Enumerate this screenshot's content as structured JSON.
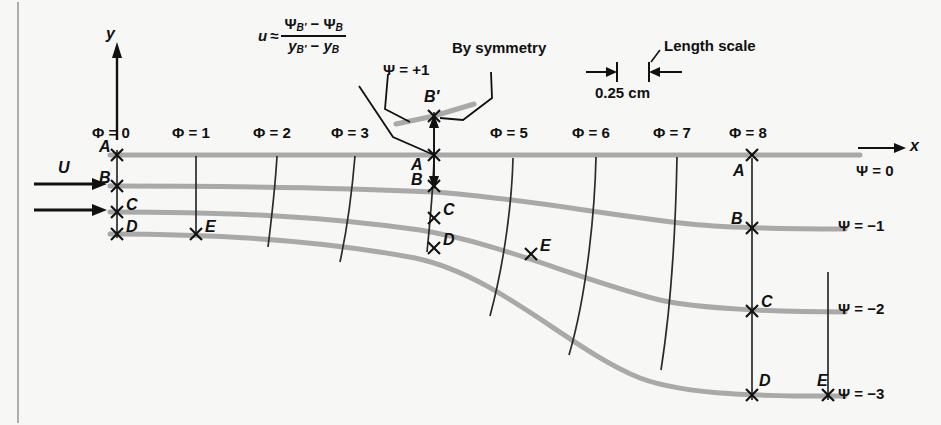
{
  "figure": {
    "background_color": "#f7f7f6",
    "streamline_color": "#a9a9a9",
    "equipotential_color": "#2b2b2b",
    "text_color": "#111111"
  },
  "axes": {
    "y_label": "y",
    "x_label": "x",
    "psi_axis_label": "Ψ = 0"
  },
  "inflow": {
    "label": "U"
  },
  "annotations": {
    "velocity_formula": {
      "lhs": "u",
      "approx": "≈",
      "numerator": "ΨB′ − ΨB",
      "denominator": "yB′ − yB"
    },
    "psi_plus_one": "Ψ = +1",
    "by_symmetry": "By symmetry",
    "length_scale_title": "Length scale",
    "length_scale_value": "0.25 cm"
  },
  "equipotentials": [
    {
      "id": "phi0",
      "label": "Φ = 0",
      "x": 117,
      "label_x": 92,
      "label_y": 131,
      "show_label": true
    },
    {
      "id": "phi1",
      "label": "Φ = 1",
      "x": 196,
      "label_x": 171,
      "label_y": 131,
      "show_label": true
    },
    {
      "id": "phi2",
      "label": "Φ = 2",
      "x": 277,
      "label_x": 252,
      "label_y": 131,
      "show_label": true
    },
    {
      "id": "phi3",
      "label": "Φ = 3",
      "x": 355,
      "label_x": 330,
      "label_y": 131,
      "show_label": true
    },
    {
      "id": "phi4",
      "label": "Φ = 4",
      "x": 434,
      "label_x": 0,
      "label_y": 0,
      "show_label": false
    },
    {
      "id": "phi5",
      "label": "Φ = 5",
      "x": 513,
      "label_x": 490,
      "label_y": 131,
      "show_label": true
    },
    {
      "id": "phi6",
      "label": "Φ = 6",
      "x": 596,
      "label_x": 571,
      "label_y": 131,
      "show_label": true
    },
    {
      "id": "phi7",
      "label": "Φ = 7",
      "x": 677,
      "label_x": 653,
      "label_y": 131,
      "show_label": true
    },
    {
      "id": "phi8",
      "label": "Φ = 8",
      "x": 752,
      "label_x": 729,
      "label_y": 131,
      "show_label": true
    }
  ],
  "streamlines": [
    {
      "id": "psi0",
      "label": "Ψ = 0",
      "label_x": 856,
      "label_y": 163,
      "show_end_label": false
    },
    {
      "id": "psi1",
      "label": "Ψ = −1",
      "label_x": 838,
      "label_y": 225,
      "show_end_label": true
    },
    {
      "id": "psi2",
      "label": "Ψ = −2",
      "label_x": 838,
      "label_y": 307,
      "show_end_label": true
    },
    {
      "id": "psi3",
      "label": "Ψ = −3",
      "label_x": 838,
      "label_y": 392,
      "show_end_label": true
    },
    {
      "id": "psiP1",
      "label": "Ψ = +1",
      "label_x": 383,
      "label_y": 62,
      "show_end_label": false
    }
  ],
  "point_markers": [
    {
      "name": "A",
      "x": 117,
      "y": 155,
      "label_x": 103,
      "label_y": 147,
      "group": "inlet"
    },
    {
      "name": "B",
      "x": 117,
      "y": 186,
      "label_x": 103,
      "label_y": 178,
      "group": "inlet"
    },
    {
      "name": "C",
      "x": 117,
      "y": 212,
      "label_x": 127,
      "label_y": 205,
      "group": "inlet"
    },
    {
      "name": "D",
      "x": 117,
      "y": 234,
      "label_x": 127,
      "label_y": 227,
      "group": "inlet"
    },
    {
      "name": "E",
      "x": 196,
      "y": 234,
      "label_x": 206,
      "label_y": 227,
      "group": "inlet"
    },
    {
      "name": "B′",
      "x": 434,
      "y": 116,
      "label_x": 424,
      "label_y": 95,
      "group": "mid"
    },
    {
      "name": "A",
      "x": 434,
      "y": 155,
      "label_x": 414,
      "label_y": 160,
      "group": "mid"
    },
    {
      "name": "B",
      "x": 434,
      "y": 186,
      "label_x": 414,
      "label_y": 180,
      "group": "mid"
    },
    {
      "name": "C",
      "x": 434,
      "y": 218,
      "label_x": 444,
      "label_y": 210,
      "group": "mid"
    },
    {
      "name": "D",
      "x": 434,
      "y": 248,
      "label_x": 444,
      "label_y": 240,
      "group": "mid"
    },
    {
      "name": "E",
      "x": 531,
      "y": 254,
      "label_x": 541,
      "label_y": 246,
      "group": "mid"
    },
    {
      "name": "A",
      "x": 752,
      "y": 155,
      "label_x": 735,
      "label_y": 172,
      "group": "outlet"
    },
    {
      "name": "B",
      "x": 752,
      "y": 228,
      "label_x": 733,
      "label_y": 220,
      "group": "outlet"
    },
    {
      "name": "C",
      "x": 752,
      "y": 311,
      "label_x": 762,
      "label_y": 303,
      "group": "outlet"
    },
    {
      "name": "D",
      "x": 752,
      "y": 395,
      "label_x": 760,
      "label_y": 383,
      "group": "outlet"
    },
    {
      "name": "E",
      "x": 828,
      "y": 395,
      "label_x": 818,
      "label_y": 383,
      "group": "outlet"
    }
  ]
}
